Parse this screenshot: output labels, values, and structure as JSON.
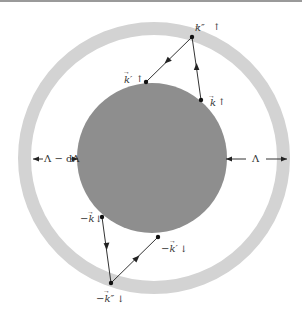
{
  "diagram": {
    "colors": {
      "outer_shell": "#d3d3d3",
      "inner_sphere": "#8e8e8e",
      "line": "#333333",
      "background": "#ffffff"
    },
    "labels": {
      "k_double_prime_up": "k″",
      "k_double_prime_up_spin": "↑",
      "k_prime_up": "k′",
      "k_prime_up_spin": "↑",
      "k_up": "k",
      "k_up_spin": "↑",
      "neg_k_down": "−k",
      "neg_k_down_spin": "↓",
      "neg_k_prime_down": "−k′",
      "neg_k_prime_down_spin": "↓",
      "neg_k_double_prime_down": "−k″",
      "neg_k_double_prime_down_spin": "↓",
      "inner_cutoff": "Λ − dΛ",
      "outer_cutoff": "Λ"
    },
    "geometry": {
      "outer_shell": {
        "cx": 154,
        "cy": 158,
        "r_outer": 136,
        "r_inner": 123
      },
      "inner_sphere": {
        "cx": 152,
        "cy": 158,
        "r": 75
      },
      "points": {
        "k_double_prime": [
          192,
          37
        ],
        "k_prime": [
          146,
          82
        ],
        "k": [
          201,
          100
        ],
        "neg_k": [
          102,
          217
        ],
        "neg_k_prime": [
          158,
          237
        ],
        "neg_k_double_prime": [
          111,
          283
        ]
      }
    }
  }
}
